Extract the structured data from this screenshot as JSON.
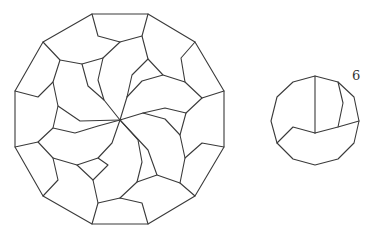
{
  "figure": {
    "stroke_color": "#3a3a3a",
    "background": "#ffffff",
    "large_tiling": {
      "name": "twelve-fold spiral dissection of a regular dodecagon",
      "center": [
        120,
        120
      ],
      "outline": [
        [
          92,
          14
        ],
        [
          148,
          14
        ],
        [
          195,
          42
        ],
        [
          224,
          91
        ],
        [
          224,
          147
        ],
        [
          195,
          196
        ],
        [
          148,
          224
        ],
        [
          92,
          224
        ],
        [
          43,
          196
        ],
        [
          15,
          147
        ],
        [
          15,
          91
        ],
        [
          43,
          42
        ]
      ],
      "inner_paths": [
        [
          [
            92,
            14
          ],
          [
            98,
            36
          ],
          [
            120,
            42
          ],
          [
            142,
            36
          ],
          [
            148,
            14
          ]
        ],
        [
          [
            120,
            42
          ],
          [
            103,
            58
          ],
          [
            98,
            80
          ],
          [
            104,
            100
          ],
          [
            120,
            120
          ]
        ],
        [
          [
            43,
            42
          ],
          [
            60,
            60
          ],
          [
            82,
            64
          ],
          [
            103,
            58
          ]
        ],
        [
          [
            82,
            64
          ],
          [
            88,
            86
          ],
          [
            104,
            100
          ]
        ],
        [
          [
            60,
            60
          ],
          [
            53,
            82
          ],
          [
            38,
            97
          ],
          [
            15,
            91
          ]
        ],
        [
          [
            53,
            82
          ],
          [
            58,
            106
          ],
          [
            80,
            121
          ],
          [
            120,
            120
          ]
        ],
        [
          [
            58,
            106
          ],
          [
            53,
            128
          ],
          [
            38,
            142
          ],
          [
            15,
            147
          ]
        ],
        [
          [
            53,
            128
          ],
          [
            75,
            133
          ],
          [
            98,
            126
          ],
          [
            120,
            120
          ]
        ],
        [
          [
            38,
            142
          ],
          [
            53,
            158
          ],
          [
            58,
            180
          ],
          [
            43,
            196
          ]
        ],
        [
          [
            53,
            158
          ],
          [
            77,
            165
          ],
          [
            98,
            158
          ],
          [
            112,
            143
          ],
          [
            120,
            120
          ]
        ],
        [
          [
            77,
            165
          ],
          [
            93,
            180
          ],
          [
            98,
            203
          ],
          [
            92,
            224
          ]
        ],
        [
          [
            98,
            158
          ],
          [
            108,
            165
          ],
          [
            93,
            180
          ]
        ],
        [
          [
            98,
            203
          ],
          [
            120,
            198
          ],
          [
            142,
            203
          ],
          [
            148,
            224
          ]
        ],
        [
          [
            120,
            198
          ],
          [
            137,
            182
          ],
          [
            142,
            162
          ],
          [
            138,
            140
          ],
          [
            120,
            120
          ]
        ],
        [
          [
            137,
            182
          ],
          [
            157,
            175
          ],
          [
            148,
            150
          ],
          [
            120,
            120
          ]
        ],
        [
          [
            157,
            175
          ],
          [
            180,
            183
          ],
          [
            195,
            196
          ]
        ],
        [
          [
            180,
            183
          ],
          [
            185,
            158
          ],
          [
            202,
            143
          ],
          [
            224,
            147
          ]
        ],
        [
          [
            185,
            158
          ],
          [
            180,
            135
          ],
          [
            165,
            119
          ],
          [
            143,
            113
          ],
          [
            120,
            120
          ]
        ],
        [
          [
            180,
            135
          ],
          [
            186,
            113
          ],
          [
            165,
            108
          ],
          [
            143,
            113
          ]
        ],
        [
          [
            186,
            113
          ],
          [
            202,
            98
          ],
          [
            224,
            91
          ]
        ],
        [
          [
            202,
            98
          ],
          [
            185,
            82
          ],
          [
            181,
            58
          ],
          [
            195,
            42
          ]
        ],
        [
          [
            185,
            82
          ],
          [
            163,
            75
          ],
          [
            148,
            59
          ],
          [
            142,
            36
          ]
        ],
        [
          [
            148,
            59
          ],
          [
            132,
            75
          ],
          [
            127,
            97
          ],
          [
            120,
            120
          ]
        ],
        [
          [
            163,
            75
          ],
          [
            142,
            81
          ],
          [
            127,
            97
          ]
        ]
      ]
    },
    "small_piece": {
      "label": "6",
      "label_position": [
        352,
        80
      ],
      "outline": [
        [
          315,
          76
        ],
        [
          338,
          82
        ],
        [
          354,
          97
        ],
        [
          359,
          121
        ],
        [
          354,
          143
        ],
        [
          338,
          159
        ],
        [
          315,
          165
        ],
        [
          293,
          159
        ],
        [
          277,
          143
        ],
        [
          271,
          121
        ],
        [
          277,
          97
        ],
        [
          293,
          82
        ]
      ],
      "inner_paths": [
        [
          [
            315,
            76
          ],
          [
            315,
            133
          ]
        ],
        [
          [
            315,
            133
          ],
          [
            338,
            127
          ],
          [
            359,
            121
          ]
        ],
        [
          [
            338,
            82
          ],
          [
            343,
            103
          ],
          [
            338,
            127
          ]
        ],
        [
          [
            315,
            133
          ],
          [
            293,
            127
          ],
          [
            277,
            143
          ]
        ]
      ]
    }
  }
}
